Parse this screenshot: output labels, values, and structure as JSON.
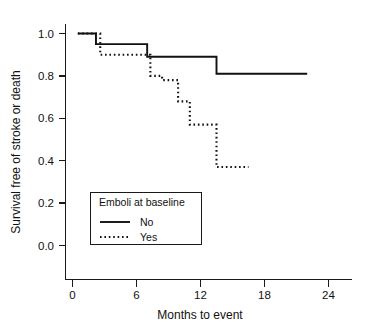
{
  "chart_data": {
    "type": "line",
    "subtype": "kaplan-meier-step",
    "title": "",
    "xlabel": "Months to event",
    "ylabel": "Survival free of stroke or death",
    "xlim": [
      0,
      25.5
    ],
    "ylim": [
      0.0,
      1.05
    ],
    "xticks": [
      0,
      6,
      12,
      18,
      24
    ],
    "xtick_labels": [
      "0",
      "6",
      "12",
      "18",
      "24"
    ],
    "yticks": [
      0.0,
      0.2,
      0.4,
      0.6,
      0.8,
      1.0
    ],
    "ytick_labels": [
      "0.0",
      "0.2",
      "0.4",
      "0.6",
      "0.8",
      "1.0"
    ],
    "grid": false,
    "legend_position": "lower-left-inside",
    "legend_title": "Emboli at baseline",
    "series": [
      {
        "name": "No",
        "style": "solid",
        "color": "#111111",
        "x": [
          0.5,
          2.2,
          2.2,
          7.0,
          7.0,
          13.5,
          13.5,
          22.0
        ],
        "y": [
          1.0,
          1.0,
          0.95,
          0.95,
          0.89,
          0.89,
          0.81,
          0.81
        ]
      },
      {
        "name": "Yes",
        "style": "dotted",
        "color": "#111111",
        "x": [
          0.5,
          2.6,
          2.6,
          7.3,
          7.3,
          8.4,
          8.4,
          9.9,
          9.9,
          11.0,
          11.0,
          13.5,
          13.5,
          16.5
        ],
        "y": [
          1.0,
          1.0,
          0.9,
          0.9,
          0.8,
          0.8,
          0.78,
          0.78,
          0.68,
          0.68,
          0.57,
          0.57,
          0.37,
          0.37
        ]
      }
    ]
  },
  "axes": {
    "x_title": "Months to event",
    "y_title": "Survival free of stroke or death",
    "x_tick_labels": [
      "0",
      "6",
      "12",
      "18",
      "24"
    ],
    "y_tick_labels": [
      "1.0",
      "0.8",
      "0.6",
      "0.4",
      "0.2",
      "0.0"
    ]
  },
  "legend": {
    "title": "Emboli at baseline",
    "entries": [
      {
        "label": "No",
        "style": "solid"
      },
      {
        "label": "Yes",
        "style": "dotted"
      }
    ]
  },
  "colors": {
    "ink": "#111111",
    "background": "#ffffff"
  }
}
